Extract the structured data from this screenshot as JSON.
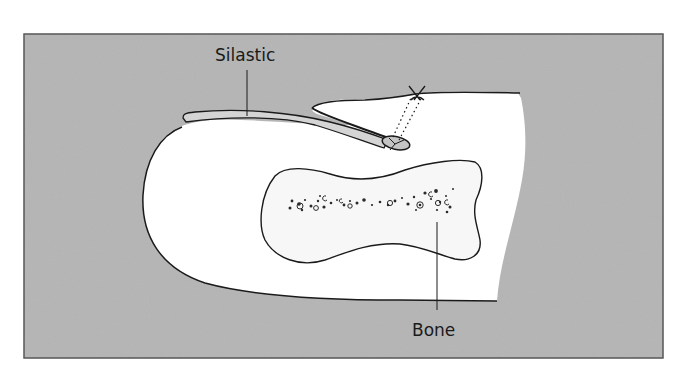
{
  "figure": {
    "type": "medical-illustration",
    "background_color": "#b5b5b5",
    "tissue_color": "#ffffff",
    "bone_fill": "#f7f7f7",
    "silastic_fill": "#d4d4d4",
    "outline_color": "#1a1a1a"
  },
  "labels": {
    "silastic": "Silastic",
    "bone": "Bone"
  },
  "annotations": {
    "suture_mark": "X"
  }
}
